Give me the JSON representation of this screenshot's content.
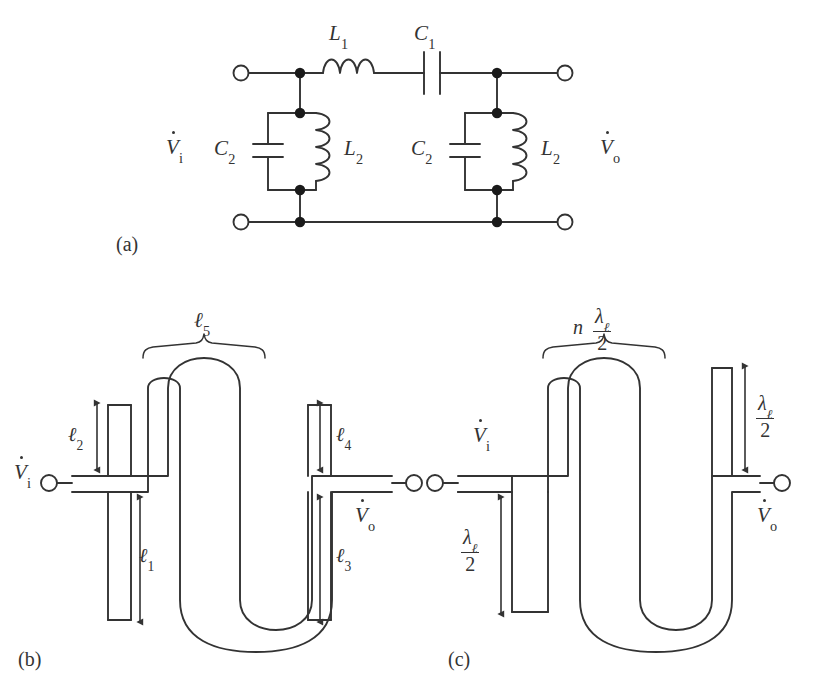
{
  "figure": {
    "type": "three-panel engineering figure",
    "background": "#ffffff",
    "ink_color": "#333333",
    "panels": [
      {
        "id": "a",
        "label": "(a)",
        "caption": "lumped-element LC bandpass filter"
      },
      {
        "id": "b",
        "label": "(b)",
        "caption": "microstrip layout with physical lengths"
      },
      {
        "id": "c",
        "label": "(c)",
        "caption": "microstrip layout with electrical lengths"
      }
    ]
  },
  "panel_a": {
    "label": "(a)",
    "input_label": {
      "base": "V",
      "dot": true,
      "sub": "i"
    },
    "output_label": {
      "base": "V",
      "dot": true,
      "sub": "o"
    },
    "series_branch": [
      {
        "name": "series-inductor",
        "symbol": "L",
        "sub": "1",
        "text": "L1"
      },
      {
        "name": "series-capacitor",
        "symbol": "C",
        "sub": "1",
        "text": "C1"
      }
    ],
    "shunt_branches": [
      {
        "name": "shunt-tank-left",
        "capacitor": {
          "symbol": "C",
          "sub": "2",
          "text": "C2"
        },
        "inductor": {
          "symbol": "L",
          "sub": "2",
          "text": "L2"
        }
      },
      {
        "name": "shunt-tank-right",
        "capacitor": {
          "symbol": "C",
          "sub": "2",
          "text": "C2"
        },
        "inductor": {
          "symbol": "L",
          "sub": "2",
          "text": "L2"
        }
      }
    ],
    "terminal_count": 4,
    "node_dot_count": 8,
    "inductor_L1_loops": 3,
    "inductor_L2_loops": 4
  },
  "panel_b": {
    "label": "(b)",
    "input_label": {
      "base": "V",
      "dot": true,
      "sub": "i"
    },
    "output_label": {
      "base": "V",
      "dot": true,
      "sub": "o"
    },
    "brace_label": {
      "symbol": "ℓ",
      "sub": "5",
      "text": "l5"
    },
    "dimensions": [
      {
        "name": "length-l2",
        "symbol": "ℓ",
        "sub": "2",
        "text": "l2",
        "position": "left stub upper arm"
      },
      {
        "name": "length-l1",
        "symbol": "ℓ",
        "sub": "1",
        "text": "l1",
        "position": "left stub lower arm"
      },
      {
        "name": "length-l4",
        "symbol": "ℓ",
        "sub": "4",
        "text": "l4",
        "position": "right stub upper arm"
      },
      {
        "name": "length-l3",
        "symbol": "ℓ",
        "sub": "3",
        "text": "l3",
        "position": "right stub lower arm"
      }
    ],
    "stub_shape": "cross",
    "meander_shape": "serpentine",
    "terminal_count": 2
  },
  "panel_c": {
    "label": "(c)",
    "input_label": {
      "base": "V",
      "dot": true,
      "sub": "i"
    },
    "output_label": {
      "base": "V",
      "dot": true,
      "sub": "o"
    },
    "brace_label": {
      "prefix": "n",
      "numerator": "λ",
      "numerator_sub": "ℓ",
      "denominator": "2",
      "text": "n lambda_l / 2"
    },
    "dimensions": [
      {
        "name": "length-half-lambda-left",
        "numerator": "λ",
        "numerator_sub": "ℓ",
        "denominator": "2",
        "text": "lambda_l / 2",
        "position": "left stub downward arm"
      },
      {
        "name": "length-half-lambda-right",
        "numerator": "λ",
        "numerator_sub": "ℓ",
        "denominator": "2",
        "text": "lambda_l / 2",
        "position": "right stub upward arm"
      }
    ],
    "stub_shape": "tee",
    "meander_shape": "serpentine",
    "terminal_count": 2
  }
}
